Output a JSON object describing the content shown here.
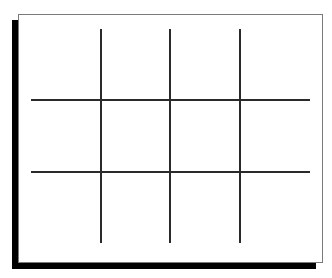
{
  "diagram": {
    "type": "tic-tac-toe-grid",
    "rows": 3,
    "cols": 3,
    "cells": [
      [
        "",
        "",
        ""
      ],
      [
        "",
        "",
        ""
      ],
      [
        "",
        "",
        ""
      ]
    ],
    "colors": {
      "background": "#ffffff",
      "frame_border": "#7a7a7a",
      "shadow": "#000000",
      "grid_line": "#2a2a2a"
    }
  }
}
